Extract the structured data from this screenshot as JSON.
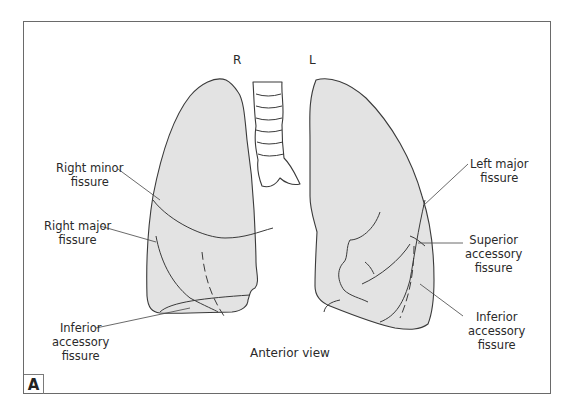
{
  "figure": {
    "panel_label": "A",
    "caption": "Anterior view",
    "side_labels": {
      "right": "R",
      "left": "L"
    },
    "colors": {
      "lung_fill": "#e3e3e3",
      "outline": "#3a3a3a",
      "frame": "#6a6a6a",
      "background": "#ffffff"
    }
  },
  "labels": {
    "right_minor_fissure": {
      "line1": "Right minor",
      "line2": "fissure"
    },
    "right_major_fissure": {
      "line1": "Right major",
      "line2": "fissure"
    },
    "inferior_accessory_right": {
      "line1": "Inferior",
      "line2": "accessory",
      "line3": "fissure"
    },
    "left_major_fissure": {
      "line1": "Left major",
      "line2": "fissure"
    },
    "superior_accessory_left": {
      "line1": "Superior",
      "line2": "accessory",
      "line3": "fissure"
    },
    "inferior_accessory_left": {
      "line1": "Inferior",
      "line2": "accessory",
      "line3": "fissure"
    }
  }
}
